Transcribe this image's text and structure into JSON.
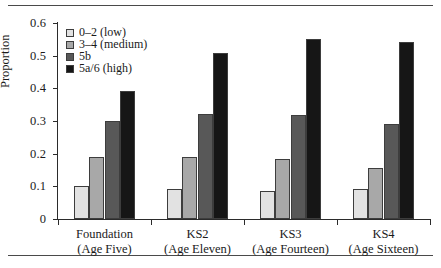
{
  "chart_data": {
    "type": "bar",
    "title": "",
    "xlabel": "",
    "ylabel": "Proportion",
    "ylim": [
      0,
      0.6
    ],
    "yticks": [
      "0",
      "0.1",
      "0.2",
      "0.3",
      "0.4",
      "0.5",
      "0.6"
    ],
    "ytick_values": [
      0,
      0.1,
      0.2,
      0.3,
      0.4,
      0.5,
      0.6
    ],
    "grid": false,
    "legend_position": "top-left",
    "categories": [
      "Foundation (Age Five)",
      "KS2 (Age Eleven)",
      "KS3 (Age Fourteen)",
      "KS4 (Age Sixteen)"
    ],
    "category_lines": [
      [
        "Foundation",
        "(Age Five)"
      ],
      [
        "KS2",
        "(Age Eleven)"
      ],
      [
        "KS3",
        "(Age Fourteen)"
      ],
      [
        "KS4",
        "(Age Sixteen)"
      ]
    ],
    "series": [
      {
        "name": "0–2 (low)",
        "color": "#e2e2e2",
        "values": [
          0.1,
          0.091,
          0.085,
          0.093
        ]
      },
      {
        "name": "3–4 (medium)",
        "color": "#a8a8a8",
        "values": [
          0.191,
          0.189,
          0.183,
          0.155
        ]
      },
      {
        "name": "5b",
        "color": "#585858",
        "values": [
          0.3,
          0.322,
          0.318,
          0.292
        ]
      },
      {
        "name": "5a/6 (high)",
        "color": "#161616",
        "values": [
          0.392,
          0.509,
          0.551,
          0.541
        ]
      }
    ]
  },
  "figure": {
    "rule_color": "#4a4a4a",
    "axis_color": "#2b2b2b",
    "background": "#ffffff"
  }
}
